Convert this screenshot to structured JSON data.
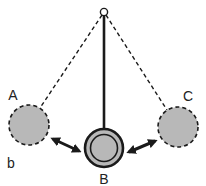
{
  "diagram": {
    "panel_label": "b",
    "colors": {
      "line": "#1a1a1a",
      "bob_fill": "#b8b8b8",
      "background": "#ffffff"
    },
    "pivot": {
      "x": 104,
      "y": 12,
      "r": 4
    },
    "bobs": [
      {
        "id": "A",
        "label": "A",
        "cx": 29,
        "cy": 125,
        "r": 20,
        "style": "dashed",
        "label_x": 13,
        "label_y": 100
      },
      {
        "id": "B",
        "label": "B",
        "cx": 104,
        "cy": 148,
        "r": 19,
        "style": "solid-double-ring",
        "label_x": 104,
        "label_y": 184
      },
      {
        "id": "C",
        "label": "C",
        "cx": 178,
        "cy": 127,
        "r": 20,
        "style": "dashed",
        "label_x": 188,
        "label_y": 101
      }
    ],
    "arrows": [
      {
        "from": "A",
        "to": "B",
        "type": "double-headed"
      },
      {
        "from": "B",
        "to": "C",
        "type": "double-headed"
      }
    ]
  }
}
